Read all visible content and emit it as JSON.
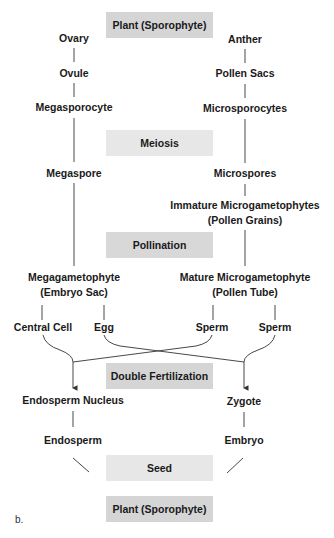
{
  "diagram": {
    "panel_label": "b.",
    "colors": {
      "box_dark": "#d5d5d5",
      "box_light": "#e7e7e7",
      "line": "#333333",
      "text": "#1a1a1a"
    },
    "stages": {
      "plant_top": "Plant (Sporophyte)",
      "meiosis": "Meiosis",
      "pollination": "Pollination",
      "double_fertilization": "Double Fertilization",
      "seed": "Seed",
      "plant_bottom": "Plant (Sporophyte)"
    },
    "female": {
      "ovary": "Ovary",
      "ovule": "Ovule",
      "megasporocyte": "Megasporocyte",
      "megaspore": "Megaspore",
      "megagametophyte": "Megagametophyte",
      "embryo_sac": "(Embryo Sac)",
      "central_cell": "Central Cell",
      "egg": "Egg",
      "endosperm_nucleus": "Endosperm Nucleus",
      "endosperm": "Endosperm"
    },
    "male": {
      "anther": "Anther",
      "pollen_sacs": "Pollen Sacs",
      "microsporocytes": "Microsporocytes",
      "microspores": "Microspores",
      "immature_microgametophytes": "Immature Microgametophytes",
      "pollen_grains": "(Pollen Grains)",
      "mature_microgametophyte": "Mature Microgametophyte",
      "pollen_tube": "(Pollen Tube)",
      "sperm_1": "Sperm",
      "sperm_2": "Sperm",
      "zygote": "Zygote",
      "embryo": "Embryo"
    }
  }
}
